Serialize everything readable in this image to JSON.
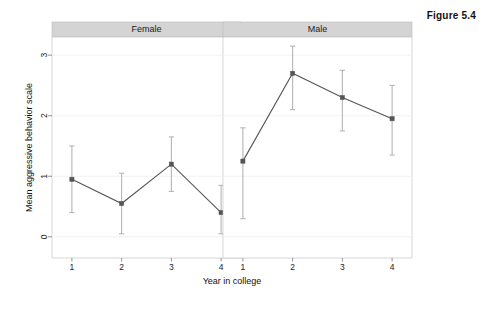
{
  "figure": {
    "caption": "Figure 5.4"
  },
  "axes": {
    "y_title": "Mean aggressive behavior scale",
    "x_title": "Year in college",
    "y_ticks": [
      "0",
      "1",
      "2",
      "3"
    ],
    "x_ticks": [
      "1",
      "2",
      "3",
      "4"
    ]
  },
  "panels": [
    {
      "label": "Female"
    },
    {
      "label": "Male"
    }
  ],
  "style": {
    "line_color": "#555555",
    "point_color": "#555555",
    "error_bar_color": "#b5b5b5",
    "strip_fill": "#d4d4d4",
    "panel_border": "#bdbdbd",
    "grid_color": "#f0f0f0",
    "background": "#ffffff"
  },
  "chart_data": {
    "type": "line",
    "title": "Figure 5.4",
    "xlabel": "Year in college",
    "ylabel": "Mean aggressive behavior scale",
    "xlim": [
      0.6,
      4.4
    ],
    "ylim": [
      -0.35,
      3.3
    ],
    "grid": true,
    "legend": "none",
    "facet_by": "sex",
    "error_bars": "95% confidence interval",
    "x": [
      1,
      2,
      3,
      4
    ],
    "categories": [
      "1",
      "2",
      "3",
      "4"
    ],
    "panels": [
      {
        "name": "Female",
        "series": [
          {
            "name": "Female",
            "values": [
              0.95,
              0.55,
              1.2,
              0.4
            ],
            "err_low": [
              0.4,
              0.05,
              0.75,
              0.05
            ],
            "err_high": [
              1.5,
              1.05,
              1.65,
              0.85
            ]
          }
        ]
      },
      {
        "name": "Male",
        "series": [
          {
            "name": "Male",
            "values": [
              1.25,
              2.7,
              2.3,
              1.95
            ],
            "err_low": [
              0.3,
              2.1,
              1.75,
              1.35
            ],
            "err_high": [
              1.8,
              3.15,
              2.75,
              2.5
            ]
          }
        ]
      }
    ]
  }
}
